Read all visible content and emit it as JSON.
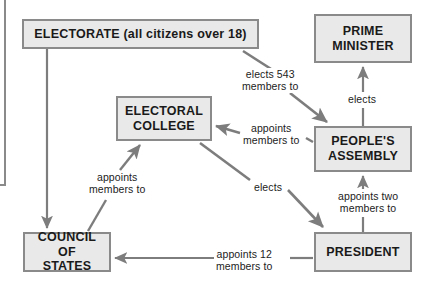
{
  "diagram": {
    "type": "flow-diagram",
    "colors": {
      "node_fill": "#e9e9e9",
      "node_border": "#8a8a8a",
      "arrow": "#7d7d7d",
      "text": "#1a1a1a",
      "background": "#ffffff"
    },
    "nodes": [
      {
        "id": "electorate",
        "label": "ELECTORATE (all citizens over 18)",
        "x": 22,
        "y": 19,
        "w": 237,
        "h": 30,
        "font_size": 12.5
      },
      {
        "id": "prime_minister",
        "label": "PRIME\nMINISTER",
        "x": 314,
        "y": 14,
        "w": 98,
        "h": 49,
        "font_size": 12.5
      },
      {
        "id": "electoral_college",
        "label": "ELECTORAL\nCOLLEGE",
        "x": 116,
        "y": 96,
        "w": 96,
        "h": 45,
        "font_size": 12.5
      },
      {
        "id": "peoples_assembly",
        "label": "PEOPLE'S\nASSEMBLY",
        "x": 314,
        "y": 126,
        "w": 98,
        "h": 46,
        "font_size": 12.5
      },
      {
        "id": "council_of_states",
        "label": "COUNCIL OF\nSTATES",
        "x": 23,
        "y": 232,
        "w": 88,
        "h": 40,
        "font_size": 12.5
      },
      {
        "id": "president",
        "label": "PRESIDENT",
        "x": 314,
        "y": 232,
        "w": 98,
        "h": 40,
        "font_size": 12.5
      }
    ],
    "edges": [
      {
        "id": "electorate-to-council",
        "from": "electorate",
        "to": "council_of_states",
        "label": "",
        "label_x": 0,
        "label_y": 0
      },
      {
        "id": "electorate-to-assembly",
        "from": "electorate",
        "to": "peoples_assembly",
        "label": "elects 543\nmembers to",
        "label_x": 242,
        "label_y": 68
      },
      {
        "id": "assembly-to-prime-minister",
        "from": "peoples_assembly",
        "to": "prime_minister",
        "label": "elects",
        "label_x": 348,
        "label_y": 93
      },
      {
        "id": "assembly-to-electoral-college",
        "from": "peoples_assembly",
        "to": "electoral_college",
        "label": "appoints\nmembers to",
        "label_x": 243,
        "label_y": 122
      },
      {
        "id": "council-to-electoral-college",
        "from": "council_of_states",
        "to": "electoral_college",
        "label": "appoints\nmembers to",
        "label_x": 89,
        "label_y": 171
      },
      {
        "id": "electoral-college-to-president",
        "from": "electoral_college",
        "to": "president",
        "label": "elects",
        "label_x": 254,
        "label_y": 181
      },
      {
        "id": "president-to-assembly",
        "from": "president",
        "to": "peoples_assembly",
        "label": "appoints two\nmembers to",
        "label_x": 338,
        "label_y": 190
      },
      {
        "id": "president-to-council",
        "from": "president",
        "to": "council_of_states",
        "label": "appoints 12\nmembers to",
        "label_x": 216,
        "label_y": 248
      }
    ]
  }
}
